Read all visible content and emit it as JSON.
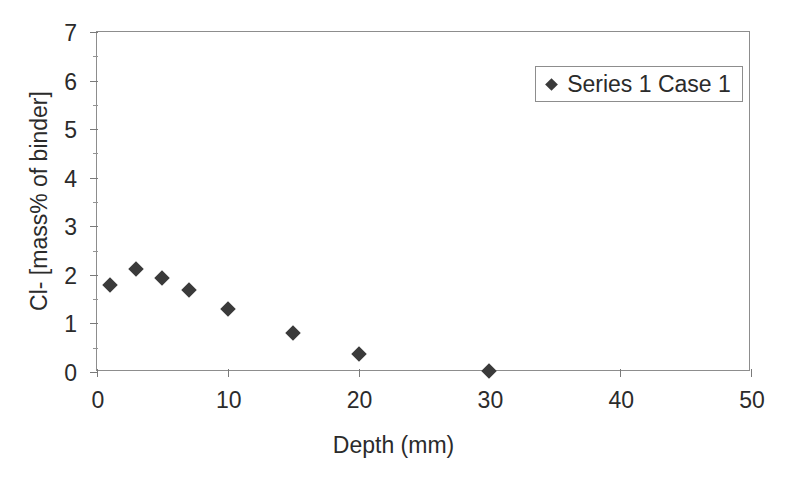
{
  "chart_data": {
    "type": "scatter",
    "title": "",
    "xlabel": "Depth (mm)",
    "ylabel": "Cl- [mass% of binder]",
    "xlim": [
      0,
      50
    ],
    "ylim": [
      0,
      7
    ],
    "xticks": [
      "0",
      "10",
      "20",
      "30",
      "40",
      "50"
    ],
    "xtick_values": [
      0,
      10,
      20,
      30,
      40,
      50
    ],
    "yticks": [
      "0",
      "1",
      "2",
      "3",
      "4",
      "5",
      "6",
      "7"
    ],
    "ytick_values": [
      0,
      1,
      2,
      3,
      4,
      5,
      6,
      7
    ],
    "y_minor_ticks": [
      0.5,
      1.5,
      2.5,
      3.5,
      4.5,
      5.5,
      6.5
    ],
    "grid": false,
    "legend_position": "top-right",
    "marker": "diamond",
    "marker_color": "#3a3a3a",
    "axis_color": "#8d8d8d",
    "background": "#ffffff",
    "series": [
      {
        "name": "Series 1 Case 1",
        "x": [
          1,
          3,
          5,
          7,
          10,
          15,
          20,
          30
        ],
        "y": [
          1.8,
          2.12,
          1.93,
          1.68,
          1.3,
          0.8,
          0.38,
          0.02
        ]
      }
    ]
  },
  "legend": {
    "entries": [
      {
        "label": "Series 1 Case 1"
      }
    ]
  }
}
